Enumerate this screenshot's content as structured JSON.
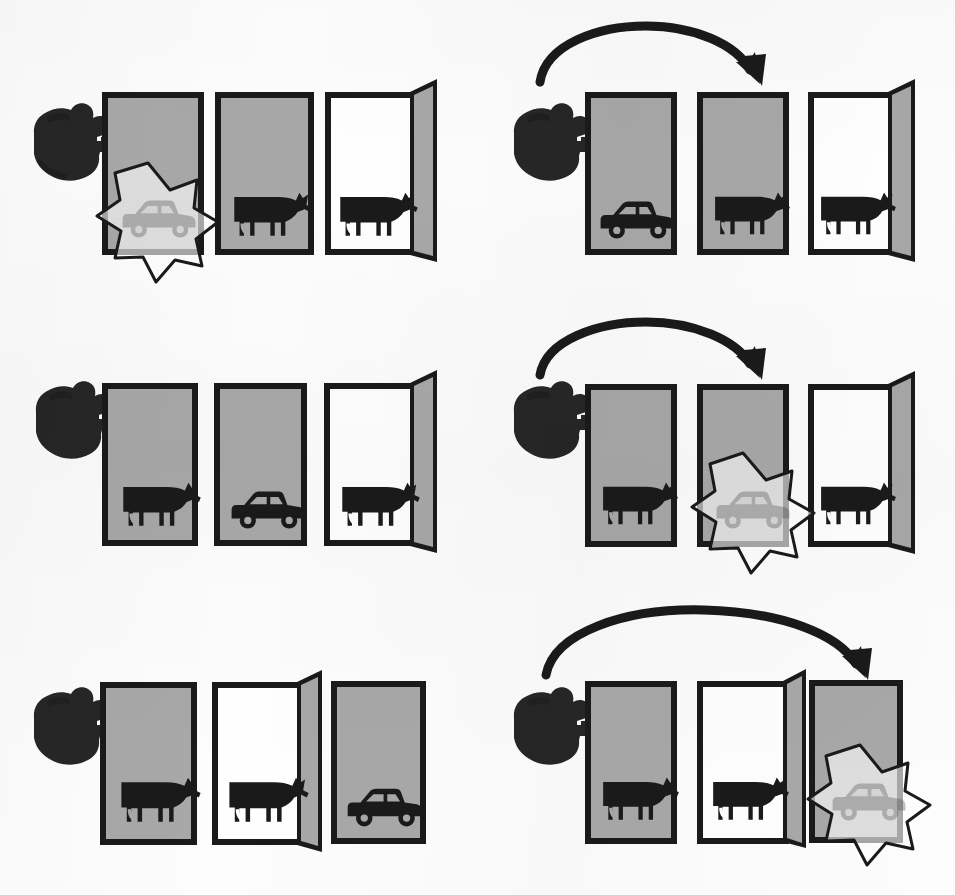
{
  "figure": {
    "title": "Monty Hall problem outcome diagram",
    "description": "Three rows of three doors each, shown twice: left column = contestant stays with door 1, right column = contestant switches after a goat door is opened.",
    "colors": {
      "door_closed_fill": "#a8a8a8",
      "door_open_fill": "#ffffff",
      "door_panel_fill": "#a8a8a8",
      "outline": "#1a1a1a",
      "icon": "#1a1a1a",
      "burst_fill": "rgba(255,255,255,0.62)",
      "burst_stroke": "#1a1a1a",
      "arrow": "#1a1a1a",
      "hand": "#262626",
      "background": "#fdfdfd"
    }
  },
  "columns": [
    {
      "name": "stay-column",
      "label": "Stay with the originally picked door"
    },
    {
      "name": "switch-column",
      "label": "Switch to the other unopened door"
    }
  ],
  "rows": [
    {
      "row_label": "Case 1 — car behind door 1",
      "stay": {
        "name": "stay-case-1",
        "hand_points_to": "door-1",
        "has_switch_arrow": false,
        "outcome": "win",
        "doors": [
          {
            "number": "1",
            "state": "closed",
            "content": "car",
            "picked": true,
            "burst": true
          },
          {
            "number": "2",
            "state": "closed",
            "content": "goat",
            "picked": false,
            "burst": false
          },
          {
            "number": "3",
            "state": "open",
            "content": "goat",
            "picked": false,
            "burst": false
          }
        ]
      },
      "switch": {
        "name": "switch-case-1",
        "hand_points_to": "door-1",
        "has_switch_arrow": true,
        "arrow_from": "door-1",
        "arrow_to": "door-2",
        "outcome": "lose",
        "doors": [
          {
            "number": "1",
            "state": "closed",
            "content": "car",
            "picked": true,
            "burst": false
          },
          {
            "number": "2",
            "state": "closed",
            "content": "goat",
            "picked": false,
            "burst": false
          },
          {
            "number": "3",
            "state": "open",
            "content": "goat",
            "picked": false,
            "burst": false
          }
        ]
      }
    },
    {
      "row_label": "Case 2 — car behind door 2",
      "stay": {
        "name": "stay-case-2",
        "hand_points_to": "door-1",
        "has_switch_arrow": false,
        "outcome": "lose",
        "doors": [
          {
            "number": "1",
            "state": "closed",
            "content": "goat",
            "picked": true,
            "burst": false
          },
          {
            "number": "2",
            "state": "closed",
            "content": "car",
            "picked": false,
            "burst": false
          },
          {
            "number": "3",
            "state": "open",
            "content": "goat",
            "picked": false,
            "burst": false
          }
        ]
      },
      "switch": {
        "name": "switch-case-2",
        "hand_points_to": "door-1",
        "has_switch_arrow": true,
        "arrow_from": "door-1",
        "arrow_to": "door-2",
        "outcome": "win",
        "doors": [
          {
            "number": "1",
            "state": "closed",
            "content": "goat",
            "picked": true,
            "burst": false
          },
          {
            "number": "2",
            "state": "closed",
            "content": "car",
            "picked": false,
            "burst": true
          },
          {
            "number": "3",
            "state": "open",
            "content": "goat",
            "picked": false,
            "burst": false
          }
        ]
      }
    },
    {
      "row_label": "Case 3 — car behind door 3",
      "stay": {
        "name": "stay-case-3",
        "hand_points_to": "door-1",
        "has_switch_arrow": false,
        "outcome": "lose",
        "doors": [
          {
            "number": "1",
            "state": "closed",
            "content": "goat",
            "picked": true,
            "burst": false
          },
          {
            "number": "2",
            "state": "open",
            "content": "goat",
            "picked": false,
            "burst": false
          },
          {
            "number": "3",
            "state": "closed",
            "content": "car",
            "picked": false,
            "burst": false
          }
        ]
      },
      "switch": {
        "name": "switch-case-3",
        "hand_points_to": "door-1",
        "has_switch_arrow": true,
        "arrow_from": "door-1",
        "arrow_to": "door-3",
        "outcome": "win",
        "doors": [
          {
            "number": "1",
            "state": "closed",
            "content": "goat",
            "picked": true,
            "burst": false
          },
          {
            "number": "2",
            "state": "open",
            "content": "goat",
            "picked": false,
            "burst": false
          },
          {
            "number": "3",
            "state": "closed",
            "content": "car",
            "picked": false,
            "burst": true
          }
        ]
      }
    }
  ],
  "icons": {
    "hand": "pointing-hand-icon",
    "goat": "goat-icon",
    "car": "car-icon",
    "burst": "starburst-icon",
    "arrow": "curved-switch-arrow-icon"
  }
}
